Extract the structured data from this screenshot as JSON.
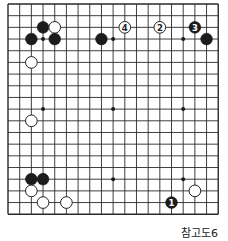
{
  "board": {
    "size": 19,
    "origin_x": 8,
    "origin_y": 4,
    "spacing": 11.68,
    "line_color": "#2a2a2a",
    "star_points": [
      [
        3,
        3
      ],
      [
        9,
        3
      ],
      [
        15,
        3
      ],
      [
        3,
        9
      ],
      [
        9,
        9
      ],
      [
        15,
        9
      ],
      [
        3,
        15
      ],
      [
        9,
        15
      ],
      [
        15,
        15
      ]
    ],
    "stones": [
      {
        "color": "black",
        "col": 3,
        "row": 2,
        "label": ""
      },
      {
        "color": "white",
        "col": 4,
        "row": 2,
        "label": ""
      },
      {
        "color": "black",
        "col": 2,
        "row": 3,
        "label": ""
      },
      {
        "color": "black",
        "col": 4,
        "row": 3,
        "label": ""
      },
      {
        "color": "black",
        "col": 8,
        "row": 3,
        "label": ""
      },
      {
        "color": "white",
        "col": 10,
        "row": 2,
        "label": "4"
      },
      {
        "color": "white",
        "col": 13,
        "row": 2,
        "label": "2"
      },
      {
        "color": "black",
        "col": 16,
        "row": 2,
        "label": "3"
      },
      {
        "color": "black",
        "col": 17,
        "row": 3,
        "label": ""
      },
      {
        "color": "white",
        "col": 2,
        "row": 5,
        "label": ""
      },
      {
        "color": "white",
        "col": 2,
        "row": 10,
        "label": ""
      },
      {
        "color": "black",
        "col": 2,
        "row": 15,
        "label": ""
      },
      {
        "color": "black",
        "col": 3,
        "row": 15,
        "label": ""
      },
      {
        "color": "white",
        "col": 2,
        "row": 16,
        "label": ""
      },
      {
        "color": "white",
        "col": 3,
        "row": 17,
        "label": ""
      },
      {
        "color": "white",
        "col": 5,
        "row": 17,
        "label": ""
      },
      {
        "color": "white",
        "col": 16,
        "row": 16,
        "label": ""
      },
      {
        "color": "black",
        "col": 14,
        "row": 17,
        "label": "1"
      }
    ]
  },
  "caption": "참고도6"
}
